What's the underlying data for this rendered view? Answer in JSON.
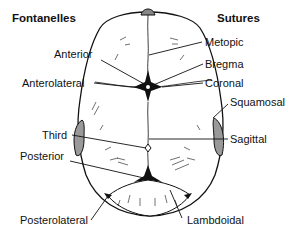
{
  "headings": {
    "left": "Fontanelles",
    "right": "Sutures"
  },
  "fontanelles": [
    {
      "label": "Anterior"
    },
    {
      "label": "Anterolateral"
    },
    {
      "label": "Third"
    },
    {
      "label": "Posterior"
    },
    {
      "label": "Posterolateral"
    }
  ],
  "sutures": [
    {
      "label": "Metopic"
    },
    {
      "label": "Bregma"
    },
    {
      "label": "Coronal"
    },
    {
      "label": "Squamosal"
    },
    {
      "label": "Sagittal"
    },
    {
      "label": "Lambdoidal"
    }
  ],
  "colors": {
    "line": "#111111",
    "fill": "#ffffff",
    "shade": "#888888"
  }
}
